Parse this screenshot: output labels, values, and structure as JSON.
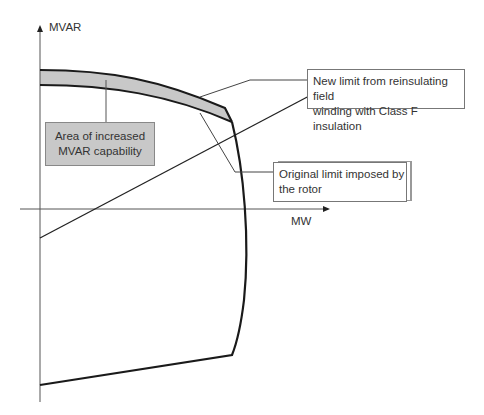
{
  "diagram": {
    "axes": {
      "y_label": "MVAR",
      "x_label": "MW"
    },
    "callouts": {
      "area": {
        "line1": "Area of increased",
        "line2": "MVAR capability"
      },
      "new_limit": {
        "line1": "New limit from reinsulating field",
        "line2": "winding with Class F insulation"
      },
      "original_limit": {
        "line1": "Original limit imposed by",
        "line2": "the rotor"
      }
    },
    "colors": {
      "curve": "#1a1a1a",
      "axis": "#444444",
      "shaded_area": "#c8c8c8",
      "text": "#333333"
    }
  }
}
